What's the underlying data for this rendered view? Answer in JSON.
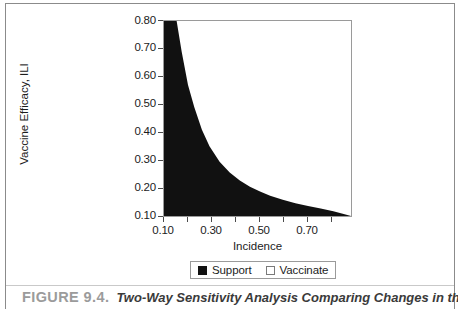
{
  "figure": {
    "caption_number": "FIGURE 9.4.",
    "caption_text": "Two-Way Sensitivity Analysis Comparing Changes in the"
  },
  "chart_data": {
    "type": "area",
    "title": "",
    "xlabel": "Incidence",
    "ylabel": "Vaccine Efficacy, ILI",
    "xlim": [
      0.08,
      0.82
    ],
    "ylim": [
      0.1,
      0.8
    ],
    "grid": false,
    "x_ticks_major": [
      0.1,
      0.3,
      0.5,
      0.7
    ],
    "x_tick_labels": [
      "0.10",
      "0.30",
      "0.50",
      "0.70"
    ],
    "x_ticks_minor": [
      0.2,
      0.4,
      0.6,
      0.8
    ],
    "y_ticks": [
      0.1,
      0.2,
      0.3,
      0.4,
      0.5,
      0.6,
      0.7,
      0.8
    ],
    "y_tick_labels": [
      "0.10",
      "0.20",
      "0.30",
      "0.40",
      "0.50",
      "0.60",
      "0.70",
      "0.80"
    ],
    "threshold_curve": {
      "description": "Boundary between Support and Vaccinate regions",
      "x": [
        0.1,
        0.115,
        0.13,
        0.15,
        0.175,
        0.2,
        0.23,
        0.26,
        0.3,
        0.34,
        0.38,
        0.42,
        0.46,
        0.5,
        0.55,
        0.6,
        0.65,
        0.7,
        0.75,
        0.78
      ],
      "y": [
        0.8,
        0.8,
        0.8,
        0.69,
        0.57,
        0.49,
        0.41,
        0.35,
        0.295,
        0.256,
        0.227,
        0.205,
        0.188,
        0.173,
        0.158,
        0.146,
        0.136,
        0.127,
        0.117,
        0.11
      ]
    },
    "regions": [
      {
        "name": "Support",
        "fill": "#111111",
        "side": "below-left"
      },
      {
        "name": "Vaccinate",
        "fill": "#ffffff",
        "side": "above-right"
      }
    ],
    "legend": {
      "position": "bottom-center",
      "entries": [
        {
          "label": "Support",
          "swatch": "filled"
        },
        {
          "label": "Vaccinate",
          "swatch": "empty"
        }
      ]
    }
  }
}
